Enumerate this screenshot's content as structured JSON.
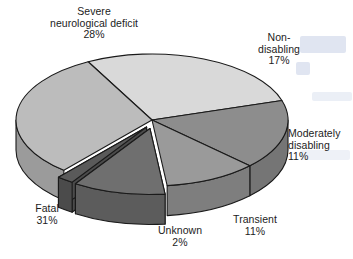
{
  "chart_data": {
    "type": "pie",
    "title": "",
    "subtitle": "",
    "xlabel": "",
    "ylabel": "",
    "legend_position": "none",
    "grid": false,
    "value_unit": "%",
    "total": 100,
    "style": "3d-exploded-pie",
    "categories": [
      "Severe neurological deficit",
      "Non-disabling",
      "Moderately disabling",
      "Transient",
      "Unknown",
      "Fatal"
    ],
    "values": [
      28,
      17,
      11,
      11,
      2,
      31
    ],
    "labels": [
      "Severe neurological deficit 28%",
      "Non-disabling 17%",
      "Moderately disabling 11%",
      "Transient 11%",
      "Unknown 2%",
      "Fatal 31%"
    ],
    "colors": [
      "#d9d9d9",
      "#8d8d8d",
      "#9a9a9a",
      "#6f6f6f",
      "#5a5a5a",
      "#bcbcbc"
    ],
    "slices": [
      {
        "name": "Severe neurological deficit",
        "value": 28,
        "percent_label": "28%",
        "color": "#d9d9d9",
        "exploded": false
      },
      {
        "name": "Non-disabling",
        "value": 17,
        "percent_label": "17%",
        "color": "#8d8d8d",
        "exploded": false
      },
      {
        "name": "Moderately disabling",
        "value": 11,
        "percent_label": "11%",
        "color": "#9a9a9a",
        "exploded": false
      },
      {
        "name": "Transient",
        "value": 11,
        "percent_label": "11%",
        "color": "#6f6f6f",
        "exploded": true
      },
      {
        "name": "Unknown",
        "value": 2,
        "percent_label": "2%",
        "color": "#5a5a5a",
        "exploded": true
      },
      {
        "name": "Fatal",
        "value": 31,
        "percent_label": "31%",
        "color": "#bcbcbc",
        "exploded": false
      }
    ]
  },
  "labels": {
    "severe": {
      "line1": "Severe",
      "line2": "neurological deficit",
      "line3": "28%"
    },
    "nondisabling": {
      "line1": "Non-",
      "line2": "disabling",
      "line3": "17%"
    },
    "moderately": {
      "line1": "Moderately",
      "line2": "disabling",
      "line3": "11%"
    },
    "transient": {
      "line1": "Transient",
      "line2": "11%"
    },
    "unknown": {
      "line1": "Unknown",
      "line2": "2%"
    },
    "fatal": {
      "line1": "Fatal",
      "line2": "31%"
    }
  },
  "palette": {
    "background": "#ffffff",
    "outline": "#1a1a1a",
    "text": "#1c1c1c",
    "severe_top": "#d9d9d9",
    "severe_side": "#b4b4b4",
    "nondisabling_top": "#8d8d8d",
    "nondisabling_side": "#757575",
    "moderately_top": "#9a9a9a",
    "moderately_side": "#7e7e7e",
    "transient_top": "#6f6f6f",
    "transient_side": "#5c5c5c",
    "unknown_top": "#5a5a5a",
    "unknown_side": "#4b4b4b",
    "fatal_top": "#bcbcbc",
    "fatal_side": "#9b9b9b"
  }
}
